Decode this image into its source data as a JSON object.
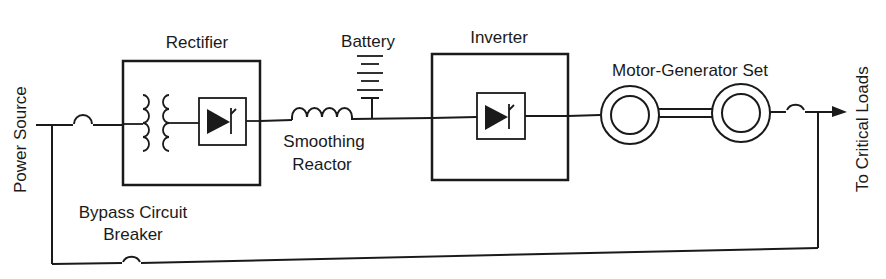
{
  "diagram": {
    "type": "block-diagram",
    "labels": {
      "power_source": "Power Source",
      "rectifier": "Rectifier",
      "battery": "Battery",
      "inverter": "Inverter",
      "motor_generator_set": "Motor-Generator Set",
      "smoothing_line1": "Smoothing",
      "smoothing_line2": "Reactor",
      "bypass_line1": "Bypass Circuit",
      "bypass_line2": "Breaker",
      "critical_loads": "To Critical Loads"
    },
    "components": [
      {
        "id": "breaker-input",
        "kind": "circuit-breaker"
      },
      {
        "id": "rectifier",
        "kind": "box",
        "contains": [
          "transformer",
          "thyristor"
        ]
      },
      {
        "id": "smoothing-reactor",
        "kind": "inductor"
      },
      {
        "id": "battery",
        "kind": "battery"
      },
      {
        "id": "inverter",
        "kind": "box",
        "contains": [
          "thyristor"
        ]
      },
      {
        "id": "motor",
        "kind": "rotating-machine"
      },
      {
        "id": "generator",
        "kind": "rotating-machine"
      },
      {
        "id": "breaker-output",
        "kind": "circuit-breaker"
      },
      {
        "id": "bypass-breaker",
        "kind": "circuit-breaker"
      }
    ],
    "colors": {
      "ink": "#1a1a1a",
      "background": "#ffffff"
    }
  }
}
